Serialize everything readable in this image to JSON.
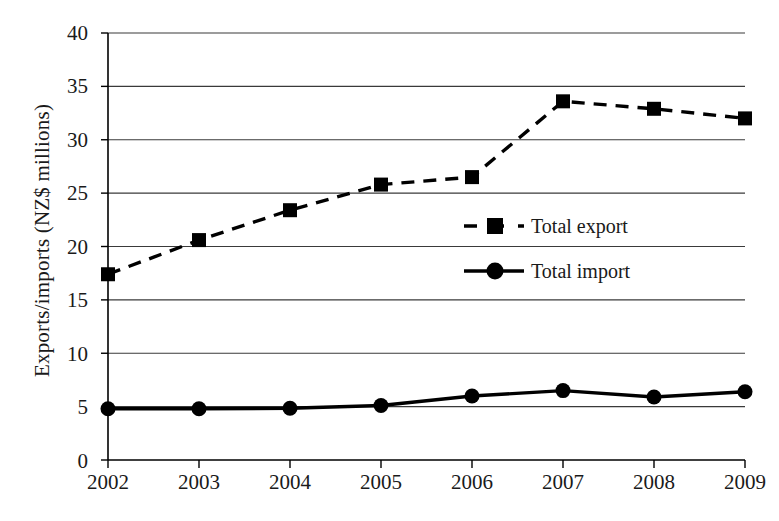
{
  "chart_data": {
    "type": "line",
    "title": "",
    "xlabel": "",
    "ylabel": "Exports/imports (NZ$ millions)",
    "categories": [
      "2002",
      "2003",
      "2004",
      "2005",
      "2006",
      "2007",
      "2008",
      "2009"
    ],
    "x": [
      2002,
      2003,
      2004,
      2005,
      2006,
      2007,
      2008,
      2009
    ],
    "xlim": [
      2002,
      2009
    ],
    "ylim": [
      0,
      40
    ],
    "ytick_labels": [
      "0",
      "5",
      "10",
      "15",
      "20",
      "25",
      "30",
      "35",
      "40"
    ],
    "yticks": [
      0,
      5,
      10,
      15,
      20,
      25,
      30,
      35,
      40
    ],
    "grid": "horizontal",
    "legend_position": "center-right-inside",
    "series": [
      {
        "name": "Total export",
        "values": [
          17.4,
          20.6,
          23.4,
          25.8,
          26.5,
          33.6,
          32.9,
          32.0
        ],
        "marker": "square",
        "linestyle": "dashed",
        "color": "#000000"
      },
      {
        "name": "Total import",
        "values": [
          4.8,
          4.8,
          4.85,
          5.1,
          6.0,
          6.5,
          5.9,
          6.4
        ],
        "marker": "circle",
        "linestyle": "solid",
        "color": "#000000"
      }
    ]
  },
  "legend": {
    "items": [
      {
        "label": "Total export"
      },
      {
        "label": "Total import"
      }
    ]
  },
  "axis": {
    "y_title": "Exports/imports (NZ$ millions)",
    "y_labels": [
      "40",
      "35",
      "30",
      "25",
      "20",
      "15",
      "10",
      "5",
      "0"
    ],
    "x_labels": [
      "2002",
      "2003",
      "2004",
      "2005",
      "2006",
      "2007",
      "2008",
      "2009"
    ]
  },
  "colors": {
    "ink": "#000000",
    "grid": "#3a3a3a",
    "background": "#ffffff"
  }
}
